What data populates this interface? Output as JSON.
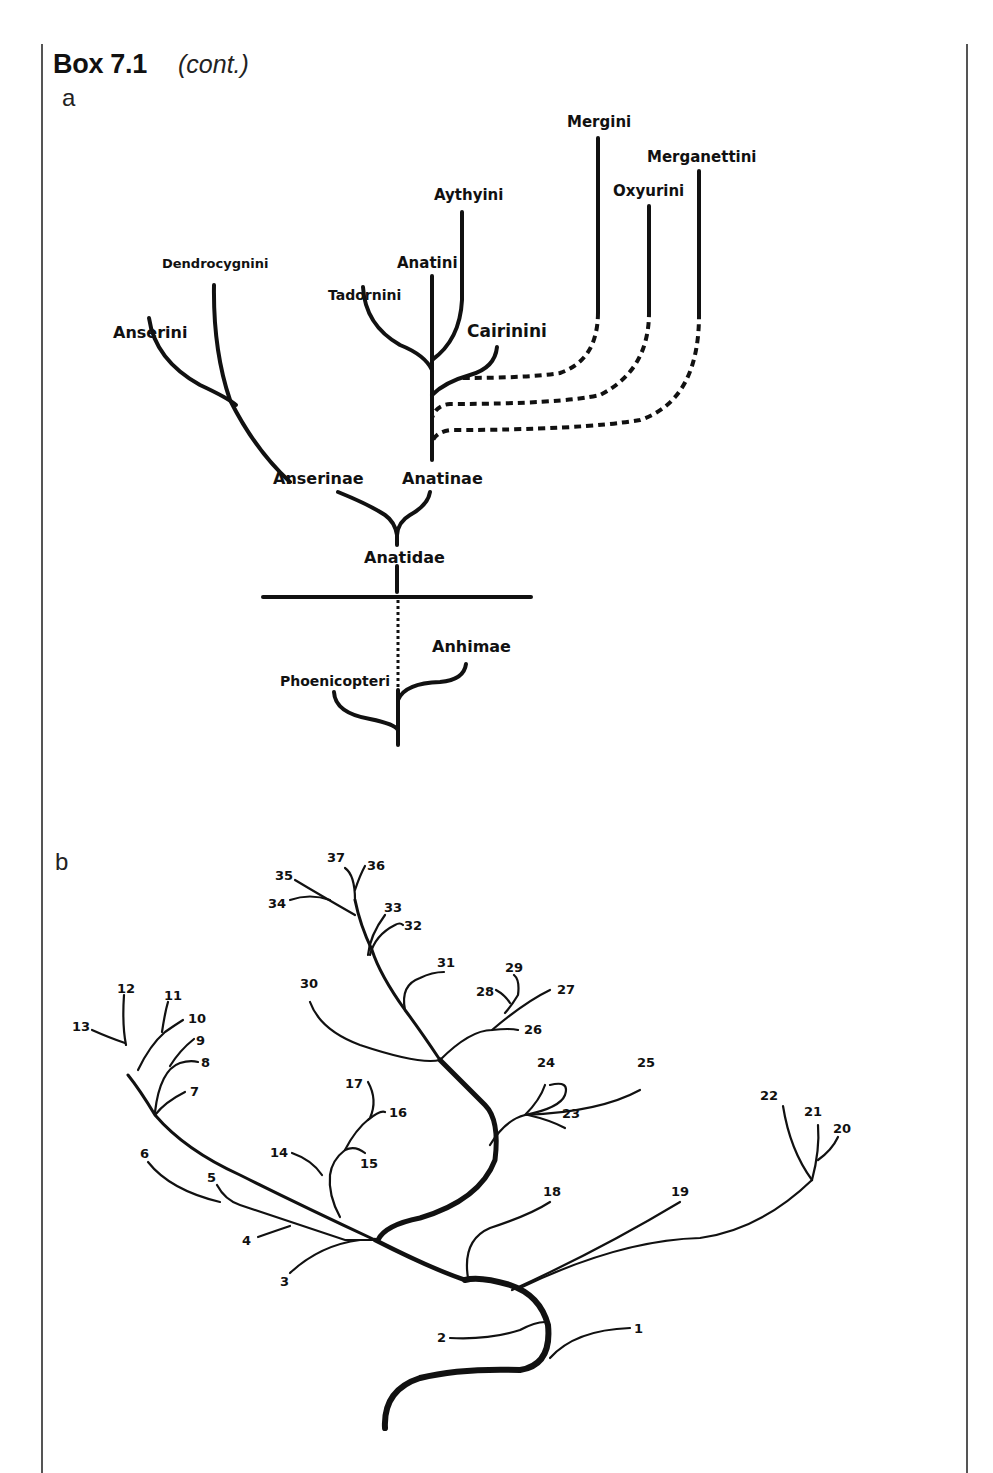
{
  "box": {
    "title": "Box 7.1",
    "continuation": "(cont.)"
  },
  "panels": {
    "a": {
      "label": "a",
      "taxa": {
        "mergini": "Mergini",
        "merganettini": "Merganettini",
        "oxyurini": "Oxyurini",
        "aythyini": "Aythyini",
        "anatini": "Anatini",
        "dendrocygnini": "Dendrocygnini",
        "tadornini": "Tadornini",
        "anserini": "Anserini",
        "cairinini": "Cairinini",
        "anserinae": "Anserinae",
        "anatinae": "Anatinae",
        "anatidae": "Anatidae",
        "anhimae": "Anhimae",
        "phoenicopteri": "Phoenicopteri"
      }
    },
    "b": {
      "label": "b",
      "tips": [
        "1",
        "2",
        "3",
        "4",
        "5",
        "6",
        "7",
        "8",
        "9",
        "10",
        "11",
        "12",
        "13",
        "14",
        "15",
        "16",
        "17",
        "18",
        "19",
        "20",
        "21",
        "22",
        "23",
        "24",
        "25",
        "26",
        "27",
        "28",
        "29",
        "30",
        "31",
        "32",
        "33",
        "34",
        "35",
        "36",
        "37"
      ]
    }
  },
  "colors": {
    "ink": "#111111",
    "frame": "#555555",
    "background": "#ffffff"
  }
}
